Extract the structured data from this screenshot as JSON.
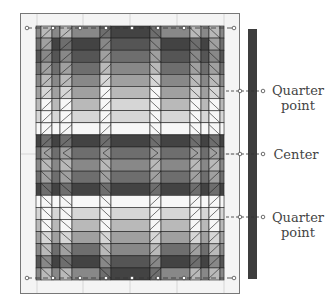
{
  "diagram": {
    "type": "quilt-layout",
    "labels": {
      "quarter_top_line1": "Quarter",
      "quarter_top_line2": "point",
      "center": "Center",
      "quarter_bottom_line1": "Quarter",
      "quarter_bottom_line2": "point"
    },
    "colors": {
      "frame_border": "#777777",
      "frame_fill": "#f4f4f4",
      "grid_line": "#cfcfcf",
      "outline": "#1e1e1e",
      "side_bar": "#3d3d3d",
      "shades": [
        "#f7f7f7",
        "#d6d6d6",
        "#b9b9b9",
        "#a0a0a0",
        "#888888",
        "#6e6e6e",
        "#555555",
        "#434343"
      ]
    },
    "rows": 21,
    "center_strip_shades": [
      7,
      6,
      5,
      4,
      3,
      2,
      1,
      1,
      0,
      7,
      5,
      4,
      5,
      7,
      0,
      1,
      2,
      3,
      4,
      6,
      7
    ],
    "side_strip_shades": [
      4,
      7,
      6,
      5,
      4,
      3,
      2,
      1,
      0,
      7,
      5,
      4,
      5,
      7,
      0,
      1,
      2,
      3,
      5,
      7,
      4
    ],
    "edge_strip_shades": [
      4,
      5,
      6,
      5,
      4,
      3,
      2,
      1,
      0,
      7,
      5,
      4,
      5,
      7,
      0,
      1,
      2,
      3,
      4,
      6,
      4
    ],
    "markers": {
      "quarter_top_y": 91,
      "center_y": 154,
      "quarter_bottom_y": 217
    }
  }
}
